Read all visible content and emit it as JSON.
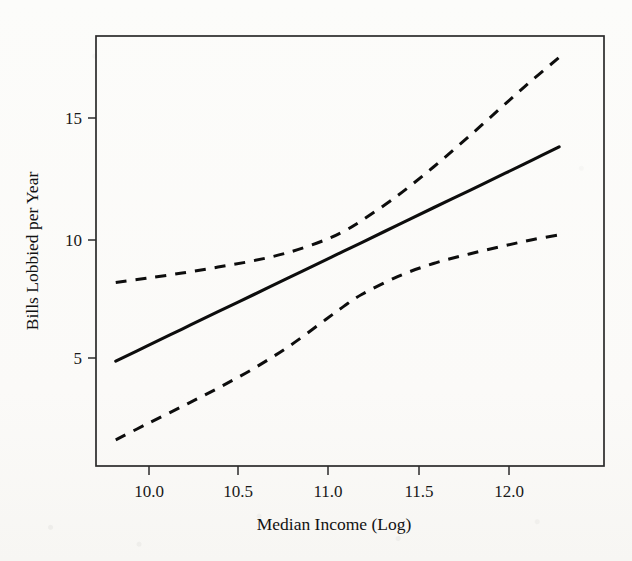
{
  "figure": {
    "background_color": "#fbfbf9",
    "ink_color": "#0d0d0d",
    "frame_color": "#2b2b2b"
  },
  "chart_data": {
    "type": "line",
    "title": "",
    "subtitle": "",
    "xlabel": "Median Income (Log)",
    "ylabel": "Bills Lobbied per Year",
    "xlim": [
      9.72,
      12.55
    ],
    "ylim": [
      0.45,
      18.5
    ],
    "xticks": [
      10.0,
      10.5,
      11.0,
      11.5,
      12.0
    ],
    "xtick_labels": [
      "10.0",
      "10.5",
      "11.0",
      "11.5",
      "12.0"
    ],
    "yticks": [
      5,
      10,
      15
    ],
    "ytick_labels": [
      "5",
      "10",
      "15"
    ],
    "grid": false,
    "legend": false,
    "legend_position": "none",
    "annotations": [],
    "x": [
      9.83,
      10.0,
      10.2,
      10.4,
      10.6,
      10.8,
      11.0,
      11.1,
      11.2,
      11.4,
      11.6,
      11.8,
      12.0,
      12.15,
      12.3
    ],
    "series": [
      {
        "name": "Predicted bills lobbied per year",
        "style": "solid",
        "values": [
          4.85,
          5.47,
          6.2,
          6.93,
          7.65,
          8.38,
          9.1,
          9.47,
          9.83,
          10.56,
          11.29,
          12.01,
          12.74,
          13.29,
          13.85
        ]
      },
      {
        "name": "Upper 95% confidence bound",
        "style": "dashed",
        "values": [
          8.15,
          8.33,
          8.55,
          8.8,
          9.07,
          9.43,
          9.95,
          10.3,
          10.75,
          11.8,
          13.0,
          14.3,
          15.65,
          16.65,
          17.6
        ]
      },
      {
        "name": "Lower 95% confidence bound",
        "style": "dashed",
        "values": [
          1.55,
          2.2,
          2.95,
          3.72,
          4.55,
          5.5,
          6.6,
          7.15,
          7.65,
          8.4,
          8.95,
          9.35,
          9.7,
          9.95,
          10.15
        ]
      }
    ]
  },
  "axes": {
    "x_title": "Median Income (Log)",
    "y_title": "Bills Lobbied per Year",
    "x_tick_0": "10.0",
    "x_tick_1": "10.5",
    "x_tick_2": "11.0",
    "x_tick_3": "11.5",
    "x_tick_4": "12.0",
    "y_tick_0": "5",
    "y_tick_1": "10",
    "y_tick_2": "15"
  }
}
